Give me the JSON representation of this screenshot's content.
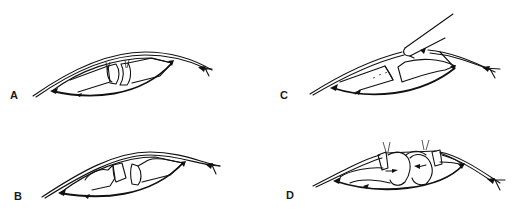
{
  "figure": {
    "panels": [
      {
        "id": "A",
        "label": "A",
        "description": "Incision with divided tissue ends approximated at center"
      },
      {
        "id": "B",
        "label": "B",
        "description": "Divided tissue ends shaped/trimmed"
      },
      {
        "id": "C",
        "label": "C",
        "description": "Instrument (scalpel) cutting beveled tissue end"
      },
      {
        "id": "D",
        "label": "D",
        "description": "Tissue ends sutured together with rounded segments"
      }
    ]
  },
  "colors": {
    "line": "#111111",
    "background": "#ffffff"
  }
}
